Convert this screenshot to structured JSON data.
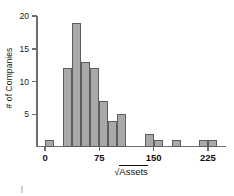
{
  "chart_data": {
    "type": "bar",
    "title": "",
    "subtitle": "",
    "xlabel": "√Assets",
    "xlabel_symbol": "√",
    "xlabel_radicand": "Assets",
    "ylabel": "# of Companies",
    "xlim": [
      -12.5,
      250
    ],
    "ylim": [
      0,
      20
    ],
    "grid": false,
    "legend": null,
    "bin_width": 12.5,
    "xticks": [
      0,
      75,
      150,
      225
    ],
    "xtick_labels": [
      "0",
      "75",
      "150",
      "225"
    ],
    "yticks": [
      5,
      10,
      15,
      20
    ],
    "ytick_labels": [
      "5",
      "10",
      "15",
      "20"
    ],
    "bar_color": "#a9a9a9",
    "bar_edge_color": "#5d5d5d",
    "axis_color": "#6e6e6e",
    "bin_starts": [
      0,
      12.5,
      25,
      37.5,
      50,
      62.5,
      75,
      87.5,
      100,
      112.5,
      125,
      137.5,
      150,
      162.5,
      175,
      187.5,
      200,
      212.5,
      225
    ],
    "categories": [
      "0-12.5",
      "12.5-25",
      "25-37.5",
      "37.5-50",
      "50-62.5",
      "62.5-75",
      "75-87.5",
      "87.5-100",
      "100-112.5",
      "112.5-125",
      "125-137.5",
      "137.5-150",
      "150-162.5",
      "162.5-175",
      "175-187.5",
      "187.5-200",
      "200-212.5",
      "212.5-225",
      "225-237.5"
    ],
    "values": [
      1,
      0,
      12,
      19,
      13,
      12,
      7,
      4,
      5,
      0,
      0,
      2,
      1,
      0,
      1,
      0,
      0,
      1,
      1
    ]
  }
}
